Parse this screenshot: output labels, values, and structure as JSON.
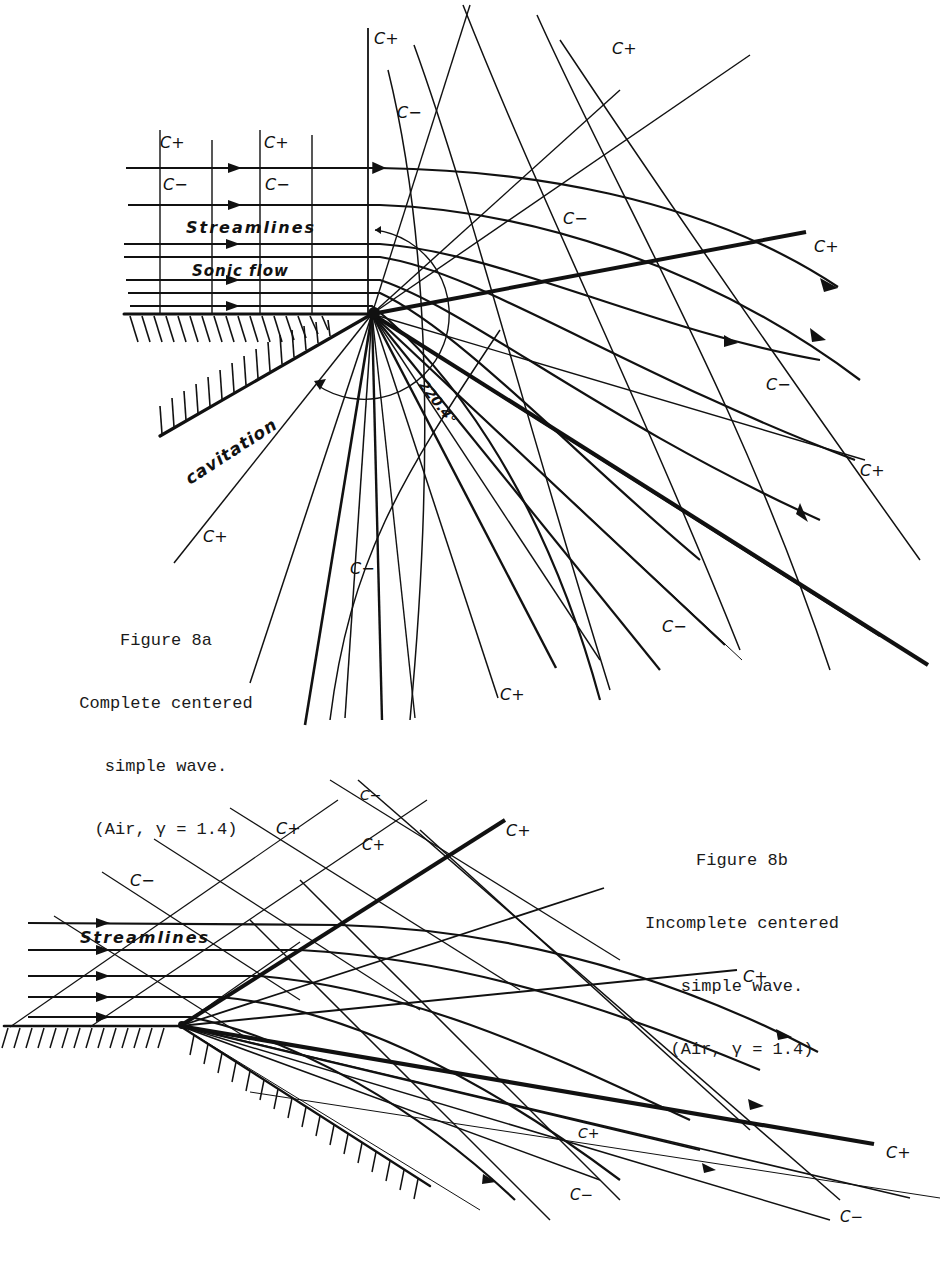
{
  "figure_a": {
    "caption": {
      "line1": "Figure 8a",
      "line2": "Complete centered",
      "line3": "simple wave.",
      "line4": "(Air, γ = 1.4)"
    },
    "labels": {
      "streamlines": "Streamlines",
      "sonic_flow": "Sonic flow",
      "cavitation": "cavitation",
      "angle": "220.4°",
      "c_plus": "C+",
      "c_minus": "C−"
    }
  },
  "figure_b": {
    "caption": {
      "line1": "Figure 8b",
      "line2": "Incomplete centered",
      "line3": "simple wave.",
      "line4": "(Air, γ = 1.4)"
    },
    "labels": {
      "streamlines": "Streamlines",
      "c_plus": "C+",
      "c_minus": "C−"
    }
  }
}
